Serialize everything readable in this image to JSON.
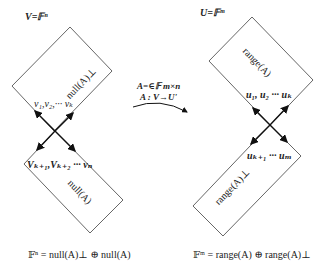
{
  "left_space": {
    "title": "V=𝔽ⁿ",
    "top_region": {
      "label": "null(A)⊥",
      "vectors": "v₁,v₂,··· vₖ"
    },
    "bottom_region": {
      "label": "null(A)",
      "vectors": "Vₖ₊₁,Vₖ₊₂ ··· vₙ"
    },
    "decomposition": "𝔽ⁿ = null(A)⊥ ⊕ null(A)"
  },
  "right_space": {
    "title": "U=𝔽ᵐ",
    "top_region": {
      "label": "range(A)",
      "vectors": "u₁, u₂ ··· uₖ"
    },
    "bottom_region": {
      "label": "range(A)⊥",
      "vectors": "uₖ₊₁ ··· uₘ"
    },
    "decomposition": "𝔽ᵐ = range(A) ⊕ range(A)⊥"
  },
  "mapping": {
    "matrix": "A=∈𝔽 m×n",
    "map": "A :  V→U'"
  },
  "colors": {
    "stroke": "#555555",
    "text": "#222222",
    "arrow": "#111111"
  }
}
